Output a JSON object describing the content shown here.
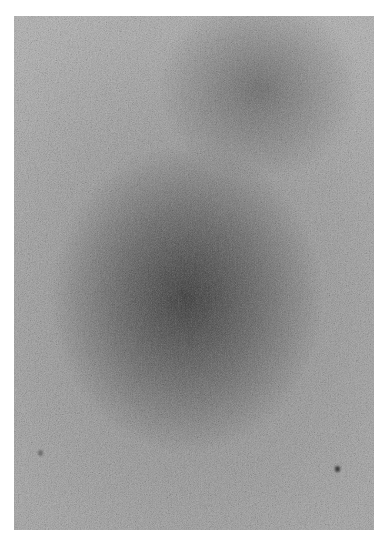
{
  "image": {
    "description": "Grayscale noise texture with darker diffuse regions, framed by a white margin",
    "frame": {
      "left": 14,
      "top": 16,
      "width": 360,
      "height": 514
    },
    "colors": {
      "margin": "#ffffff",
      "base_gray": "#8e8e8e",
      "light_gray": "#a8a8a8",
      "dark_region": "#2e2e2e",
      "speck": "#3a3a3a"
    },
    "dark_regions": [
      {
        "name": "center-blob",
        "cx_pct": 48,
        "cy_pct": 55,
        "rx_pct": 38,
        "ry_pct": 30
      },
      {
        "name": "upper-right-blob",
        "cx_pct": 68,
        "cy_pct": 14,
        "rx_pct": 28,
        "ry_pct": 18
      }
    ],
    "specks": [
      {
        "x": 335,
        "y": 466
      },
      {
        "x": 38,
        "y": 450
      }
    ]
  }
}
